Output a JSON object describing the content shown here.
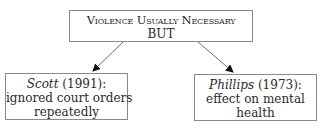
{
  "top_box": {
    "line1": "Violence Usually Necessary",
    "line2": "BUT"
  },
  "left_box": {
    "author": "Scott",
    "year": " (1991):",
    "line2": "ignored court orders",
    "line3": "repeatedly"
  },
  "right_box": {
    "author": "Phillips",
    "year": " (1973):",
    "line2": "effect on mental",
    "line3": "health"
  },
  "colors": {
    "border": "#8a8a8a",
    "arrow": "#6e6e6e",
    "arrowhead": "#111111",
    "text": "#2a2a2a"
  }
}
